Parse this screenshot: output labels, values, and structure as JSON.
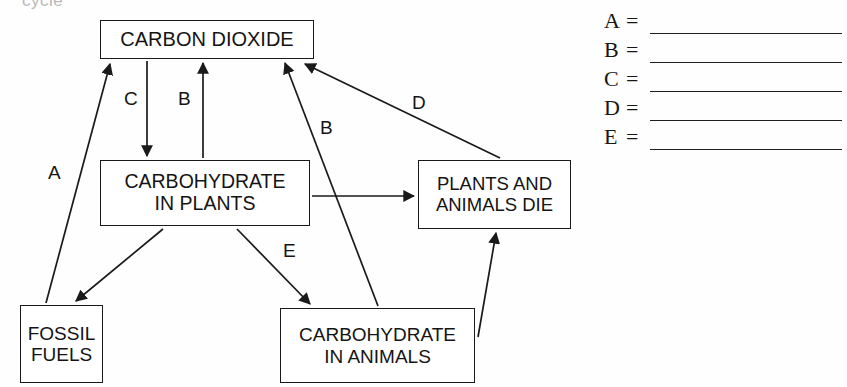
{
  "heading": {
    "cropped_text": "cycle"
  },
  "diagram": {
    "nodes": [
      {
        "id": "co2",
        "lines": [
          "CARBON DIOXIDE"
        ]
      },
      {
        "id": "carb_plants",
        "lines": [
          "CARBOHYDRATE",
          "IN PLANTS"
        ]
      },
      {
        "id": "die",
        "lines": [
          "PLANTS AND",
          "ANIMALS DIE"
        ]
      },
      {
        "id": "fossil",
        "lines": [
          "FOSSIL",
          "FUELS"
        ]
      },
      {
        "id": "carb_animals",
        "lines": [
          "CARBOHYDRATE",
          "IN ANIMALS"
        ]
      }
    ],
    "arrow_labels": {
      "a": "A",
      "c": "C",
      "b_left": "B",
      "b_right": "B",
      "d": "D",
      "e": "E"
    },
    "arrows": [
      {
        "label": "A",
        "from": "fossil",
        "to": "co2"
      },
      {
        "label": "C",
        "from": "co2",
        "to": "carb_plants"
      },
      {
        "label": "B",
        "from": "carb_plants",
        "to": "co2"
      },
      {
        "label": "B",
        "from": "carb_animals",
        "to": "co2"
      },
      {
        "label": "D",
        "from": "die",
        "to": "co2"
      },
      {
        "label": "E",
        "from": "carb_plants",
        "to": "carb_animals"
      },
      {
        "label": "",
        "from": "carb_plants",
        "to": "fossil"
      },
      {
        "label": "",
        "from": "carb_plants",
        "to": "die"
      },
      {
        "label": "",
        "from": "carb_animals",
        "to": "die"
      }
    ]
  },
  "answer_key": {
    "rows": [
      {
        "letter": "A",
        "equals": "=",
        "value": ""
      },
      {
        "letter": "B",
        "equals": "=",
        "value": ""
      },
      {
        "letter": "C",
        "equals": "=",
        "value": ""
      },
      {
        "letter": "D",
        "equals": "=",
        "value": ""
      },
      {
        "letter": "E",
        "equals": "=",
        "value": ""
      }
    ]
  },
  "colors": {
    "ink": "#1a1a1a",
    "paper": "#fefefe",
    "faint": "#b9b9b9"
  }
}
